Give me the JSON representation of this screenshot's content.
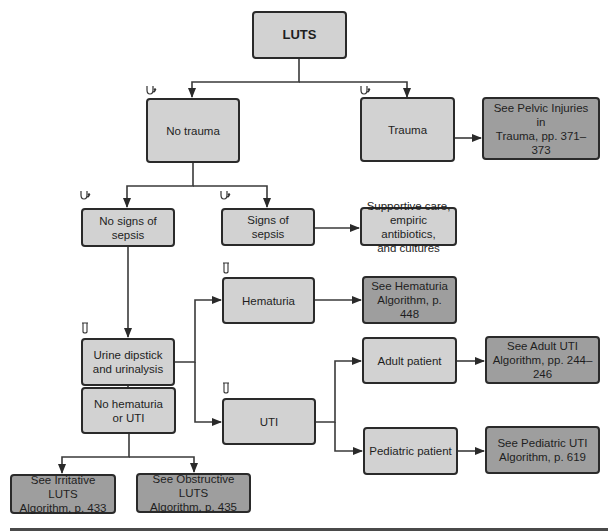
{
  "colors": {
    "node_fill": "#d2d2d2",
    "reference_fill": "#9e9e9e",
    "border": "#2a2a2a",
    "line": "#3a3a3a"
  },
  "legend_icons": {
    "exam": "stethoscope-icon",
    "lab": "test-tube-icon"
  },
  "nodes": {
    "luts": {
      "label": "LUTS"
    },
    "no_trauma": {
      "label": "No trauma",
      "icon": "stethoscope-icon"
    },
    "trauma": {
      "label": "Trauma",
      "icon": "stethoscope-icon"
    },
    "pelvic_ref": {
      "label": "See Pelvic Injuries in\nTrauma, pp. 371–373"
    },
    "no_sepsis": {
      "label": "No signs of\nsepsis",
      "icon": "stethoscope-icon"
    },
    "sepsis": {
      "label": "Signs of\nsepsis",
      "icon": "stethoscope-icon"
    },
    "supportive": {
      "label": "Supportive care,\nempiric antibiotics,\nand cultures"
    },
    "hematuria": {
      "label": "Hematuria",
      "icon": "test-tube-icon"
    },
    "hematuria_ref": {
      "label": "See Hematuria\nAlgorithm, p. 448"
    },
    "urine": {
      "label": "Urine dipstick\nand urinalysis",
      "icon": "test-tube-icon"
    },
    "adult": {
      "label": "Adult patient"
    },
    "adult_ref": {
      "label": "See Adult UTI\nAlgorithm, pp. 244–246"
    },
    "uti": {
      "label": "UTI",
      "icon": "test-tube-icon"
    },
    "no_hematuria": {
      "label": "No hematuria\nor UTI",
      "icon": "test-tube-icon"
    },
    "pediatric": {
      "label": "Pediatric patient"
    },
    "pediatric_ref": {
      "label": "See Pediatric UTI\nAlgorithm, p. 619"
    },
    "irritative_ref": {
      "label": "See Irritative LUTS\nAlgorithm, p. 433"
    },
    "obstructive_ref": {
      "label": "See Obstructive LUTS\nAlgorithm, p. 435"
    }
  }
}
